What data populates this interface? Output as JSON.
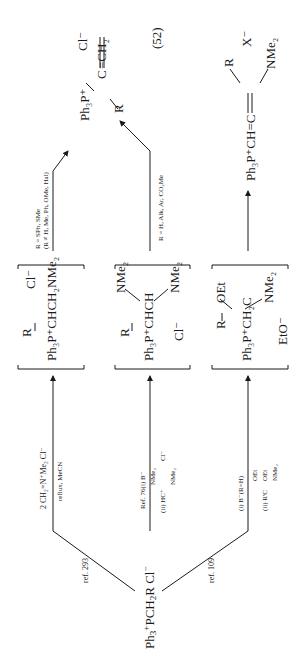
{
  "equation_number": "(52)",
  "start": {
    "prefix": "Ph",
    "sub3": "3",
    "charge": "+",
    "main": "PCH",
    "sub2": "2",
    "rest": "R",
    "anion": "Cl",
    "anion_charge": "−"
  },
  "branches": {
    "upper_ref": "ref. 293",
    "lower_ref": "ref. 109"
  },
  "row1": {
    "reagent_line1": "2 CH₂=N⁺Me₂ Cl⁻",
    "reagent_line2": "reflux, MeCN",
    "intermediate_substituent": "R",
    "intermediate_main": "Ph₃P⁺CHCH₂NMe₂",
    "intermediate_anion": "Cl⁻",
    "condition_line1": "R = SPh, SMe",
    "condition_line2": "(R ≠ H, Me, Ph, OMe, Hal)"
  },
  "row2": {
    "reagent_line1": "Ref. 76(i) B⁻",
    "reagent_line2_prefix": "(ii) HC⁺",
    "reagent_line2_sub_a": "NMe₂",
    "reagent_line2_sub_b": "NMe₂",
    "reagent_anion": "Cl⁻",
    "intermediate_substituent": "R",
    "intermediate_main": "Ph₃P⁺CHCH",
    "intermediate_sub_a": "NMe₂",
    "intermediate_sub_b": "NMe₂",
    "intermediate_anion": "Cl⁻",
    "condition_line1": "R = H, Alk, Ar, CO₂Me"
  },
  "row3": {
    "reagent_line1": "(i)   B⁻(R=H)",
    "reagent_line2_prefix": "(ii) R'C",
    "reagent_line2_sub_a": "OEt",
    "reagent_line2_sub_b": "OEt",
    "reagent_line2_sub_c": "NMe₂",
    "intermediate_substituent": "R",
    "intermediate_main": "Ph₃P⁺CH₂C",
    "intermediate_sub_a": "OEt",
    "intermediate_sub_b": "NMe₂",
    "intermediate_anion": "EtO⁻"
  },
  "product_top": {
    "left": "Ph₃P⁺",
    "center": "C",
    "right": "=CH₂",
    "substituent": "R",
    "anion": "Cl⁻"
  },
  "product_bottom": {
    "left": "Ph₃P⁺CH=C",
    "substituent_top": "R",
    "substituent_bottom": "NMe₂",
    "anion": "X⁻"
  }
}
